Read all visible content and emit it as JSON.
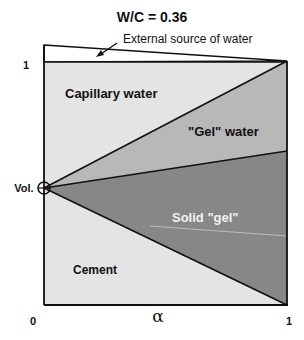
{
  "title": "W/C = 0.36",
  "annotation": "External source of water",
  "axes": {
    "y_label": "Vol.",
    "y_tick_top": "1",
    "x_label": "α",
    "x_tick_left": "0",
    "x_tick_right": "1"
  },
  "regions": {
    "capillary_water": "Capillary water",
    "gel_water": "\"Gel\" water",
    "solid_gel": "Solid \"gel\"",
    "cement": "Cement"
  },
  "colors": {
    "light_region": "#e4e4e4",
    "gel_water": "#b8b8b8",
    "solid_gel": "#878787",
    "line": "#111111",
    "background": "#ffffff"
  }
}
